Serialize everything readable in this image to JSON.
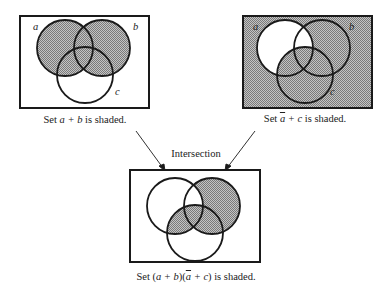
{
  "diagrams": [
    {
      "id": "left",
      "caption_prefix": "Set ",
      "caption_expr": "a + b",
      "caption_suffix": " is shaded.",
      "labels": {
        "a": "a",
        "b": "b",
        "c": "c"
      },
      "shaded_regions": "a ∪ b"
    },
    {
      "id": "right",
      "caption_prefix": "Set ",
      "caption_abar": "a",
      "caption_rest": " + c",
      "caption_suffix": " is shaded.",
      "labels": {
        "a": "a",
        "b": "b",
        "c": "c"
      },
      "shaded_regions": "complement(a) ∪ c"
    },
    {
      "id": "result",
      "caption_prefix": "Set (",
      "caption_p1": "a + b",
      "caption_mid": ")(",
      "caption_abar": "a",
      "caption_rest": " + c",
      "caption_end": ") is shaded.",
      "shaded_regions": "(a ∪ b) ∩ (complement(a) ∪ c)"
    }
  ],
  "intersection_label": "Intersection",
  "colors": {
    "line": "#1a1a1a",
    "shade": "#9a9a9a",
    "background": "#ffffff"
  }
}
